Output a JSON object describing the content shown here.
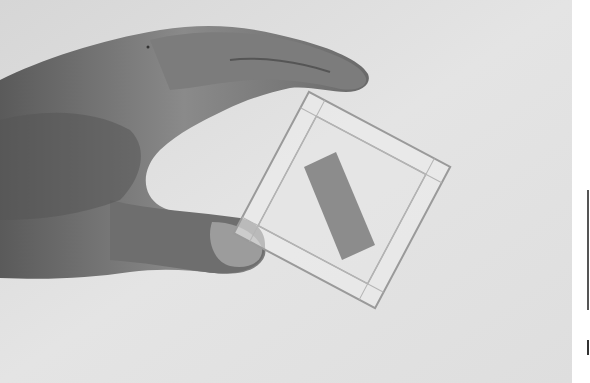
{
  "image": {
    "description": "Grayscale photograph of a hand holding a transparent square slide frame containing a gray rectangle",
    "colors": {
      "background": "#dcdcdc",
      "background_light": "#ebebeb",
      "hand": "#7a7a7a",
      "hand_dark": "#4a4a4a",
      "frame": "#e8e8e8",
      "frame_edge": "#9a9a9a",
      "rectangle": "#8c8c8c",
      "page_margin": "#ffffff"
    }
  }
}
